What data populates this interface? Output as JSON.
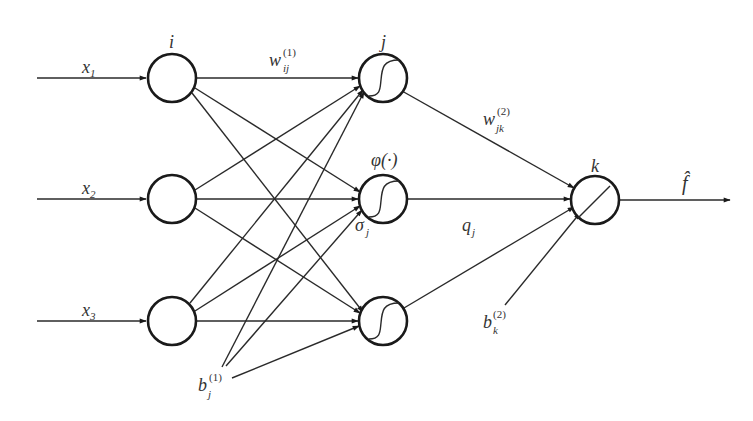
{
  "diagram": {
    "type": "feedforward-neural-network",
    "colors": {
      "stroke": "#1a1a1a",
      "text": "#333333",
      "background": "#ffffff"
    },
    "labels": {
      "input_layer": "i",
      "hidden_layer": "j",
      "output_layer": "k",
      "weight_layer1": {
        "base": "w",
        "sub": "ij",
        "sup": "(1)"
      },
      "weight_layer2": {
        "base": "w",
        "sub": "jk",
        "sup": "(2)"
      },
      "activation": "φ(·)",
      "hidden_input": {
        "base": "σ",
        "sub": "j"
      },
      "hidden_output": {
        "base": "q",
        "sub": "j"
      },
      "bias_hidden": {
        "base": "b",
        "sub": "j",
        "sup": "(1)"
      },
      "bias_output": {
        "base": "b",
        "sub": "k",
        "sup": "(2)"
      },
      "output": "f̂",
      "inputs": [
        {
          "base": "x",
          "sub": "1"
        },
        {
          "base": "x",
          "sub": "2"
        },
        {
          "base": "x",
          "sub": "3"
        }
      ]
    },
    "nodes": {
      "input": [
        {
          "id": "i1",
          "cx": 172,
          "cy": 78,
          "glyph": "none"
        },
        {
          "id": "i2",
          "cx": 172,
          "cy": 199,
          "glyph": "none"
        },
        {
          "id": "i3",
          "cx": 172,
          "cy": 321,
          "glyph": "none"
        }
      ],
      "hidden": [
        {
          "id": "h1",
          "cx": 383,
          "cy": 78,
          "glyph": "sigmoid"
        },
        {
          "id": "h2",
          "cx": 383,
          "cy": 199,
          "glyph": "sigmoid"
        },
        {
          "id": "h3",
          "cx": 383,
          "cy": 321,
          "glyph": "sigmoid"
        }
      ],
      "output": [
        {
          "id": "o1",
          "cx": 595,
          "cy": 200,
          "glyph": "linear"
        }
      ]
    }
  }
}
